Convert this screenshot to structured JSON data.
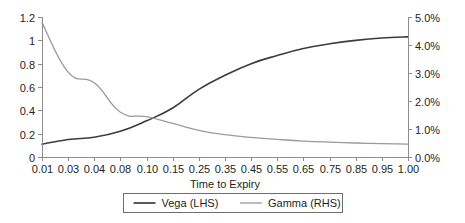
{
  "chart_data": {
    "type": "line",
    "title": "",
    "xlabel": "Time to Expiry",
    "ylabel": "",
    "categories": [
      "0.01",
      "0.03",
      "0.04",
      "0.08",
      "0.10",
      "0.15",
      "0.25",
      "0.35",
      "0.45",
      "0.55",
      "0.65",
      "0.75",
      "0.85",
      "0.95",
      "1.00"
    ],
    "grid": false,
    "legend_position": "bottom",
    "axes": {
      "left": {
        "label": "",
        "ticks": [
          "0",
          "0.2",
          "0.4",
          "0.6",
          "0.8",
          "1",
          "1.2"
        ],
        "tick_values": [
          0,
          0.2,
          0.4,
          0.6,
          0.8,
          1.0,
          1.2
        ],
        "min": 0,
        "max": 1.2
      },
      "right": {
        "label": "",
        "ticks": [
          "0.0%",
          "1.0%",
          "2.0%",
          "3.0%",
          "4.0%",
          "5.0%"
        ],
        "tick_values": [
          0,
          1,
          2,
          3,
          4,
          5
        ],
        "min": 0,
        "max": 5
      }
    },
    "series": [
      {
        "name": "Vega (LHS)",
        "axis": "left",
        "color": "#3c3c3c",
        "width": 1.6,
        "values": [
          0.11,
          0.15,
          0.17,
          0.22,
          0.31,
          0.42,
          0.58,
          0.7,
          0.8,
          0.87,
          0.93,
          0.97,
          1.0,
          1.02,
          1.03
        ]
      },
      {
        "name": "Gamma (RHS)",
        "axis": "right",
        "color": "#9a9a9a",
        "width": 1.3,
        "values": [
          4.8,
          3.03,
          2.65,
          1.6,
          1.44,
          1.2,
          0.95,
          0.8,
          0.7,
          0.63,
          0.57,
          0.53,
          0.5,
          0.48,
          0.46
        ]
      }
    ]
  },
  "legend": {
    "items": [
      {
        "label": "Vega (LHS)",
        "color": "#3c3c3c"
      },
      {
        "label": "Gamma (RHS)",
        "color": "#9a9a9a"
      }
    ]
  }
}
